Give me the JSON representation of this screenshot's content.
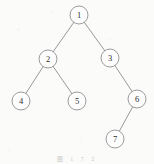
{
  "figure": {
    "kind": "binary-tree-diagram",
    "width": 154,
    "height": 164,
    "background_color": "#fbfbfa",
    "stroke_color": "#8d8d8d",
    "node_fill_color": "#fdfdfd",
    "node_stroke_color": "#909090",
    "label_color": "#2e2e2e",
    "node_radius": 9,
    "caption": {
      "text": "图  1 7  2",
      "visible": true,
      "legible": false,
      "x": 0,
      "y": 154,
      "color": "#c9c9c9"
    }
  },
  "chart_data": {
    "type": "diagram",
    "title": "",
    "nodes": [
      {
        "id": "n1",
        "label": "1",
        "x": 79,
        "y": 15,
        "radius": 9,
        "depth": 0
      },
      {
        "id": "n2",
        "label": "2",
        "x": 48,
        "y": 59,
        "radius": 9,
        "depth": 1
      },
      {
        "id": "n3",
        "label": "3",
        "x": 110,
        "y": 58,
        "radius": 9,
        "depth": 1
      },
      {
        "id": "n4",
        "label": "4",
        "x": 21,
        "y": 101,
        "radius": 9,
        "depth": 2
      },
      {
        "id": "n5",
        "label": "5",
        "x": 77,
        "y": 101,
        "radius": 9,
        "depth": 2
      },
      {
        "id": "n6",
        "label": "6",
        "x": 137,
        "y": 99,
        "radius": 9,
        "depth": 2
      },
      {
        "id": "n7",
        "label": "7",
        "x": 115,
        "y": 139,
        "radius": 9,
        "depth": 3
      }
    ],
    "edges": [
      {
        "from": "n1",
        "to": "n2",
        "side": "left"
      },
      {
        "from": "n1",
        "to": "n3",
        "side": "right"
      },
      {
        "from": "n2",
        "to": "n4",
        "side": "left"
      },
      {
        "from": "n2",
        "to": "n5",
        "side": "right"
      },
      {
        "from": "n3",
        "to": "n6",
        "side": "right"
      },
      {
        "from": "n6",
        "to": "n7",
        "side": "left"
      }
    ]
  }
}
